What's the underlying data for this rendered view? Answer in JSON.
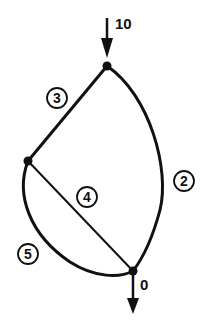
{
  "diagram": {
    "type": "network-graph",
    "nodes": [
      {
        "id": "top",
        "x": 107,
        "y": 66
      },
      {
        "id": "left",
        "x": 28,
        "y": 161
      },
      {
        "id": "bottom",
        "x": 133,
        "y": 271
      }
    ],
    "edges": [
      {
        "id": "edge-2",
        "label": "2",
        "from": "top",
        "to": "bottom",
        "shape": "curve-right"
      },
      {
        "id": "edge-3",
        "label": "3",
        "from": "top",
        "to": "left",
        "shape": "straight"
      },
      {
        "id": "edge-4",
        "label": "4",
        "from": "left",
        "to": "bottom",
        "shape": "straight"
      },
      {
        "id": "edge-5",
        "label": "5",
        "from": "left",
        "to": "bottom",
        "shape": "curve-left"
      }
    ],
    "inflow": {
      "label": "10",
      "node": "top"
    },
    "outflow": {
      "label": "0",
      "node": "bottom"
    },
    "colors": {
      "stroke": "#111111",
      "background": "#ffffff"
    }
  }
}
